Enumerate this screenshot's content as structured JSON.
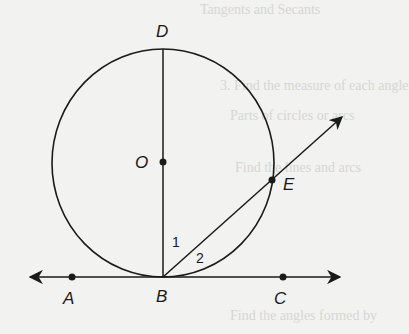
{
  "diagram": {
    "type": "geometry",
    "points": {
      "D": "D",
      "O": "O",
      "E": "E",
      "A": "A",
      "B": "B",
      "C": "C"
    },
    "angles": {
      "angle1": "1",
      "angle2": "2"
    }
  },
  "background_text": {
    "line1": "Tangents and Secants",
    "line2": "3. Find the measure of each angle",
    "line3": "Parts of circles or arcs",
    "line4": "Find the lines and arcs",
    "line5": "Find the angles formed by"
  },
  "colors": {
    "ink": "#1a1a1a",
    "paper": "#f2f2f0"
  }
}
